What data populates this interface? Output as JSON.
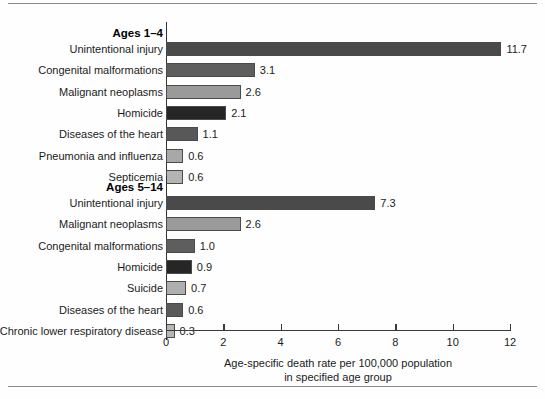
{
  "chart_data": {
    "type": "bar",
    "orientation": "horizontal",
    "title": "",
    "xlabel": "Age-specific death rate per 100,000 population in specified age group",
    "ylabel": "",
    "xlim": [
      0,
      12
    ],
    "xticks": [
      0,
      2,
      4,
      6,
      8,
      10,
      12
    ],
    "xtick_labels": [
      "0",
      "2",
      "4",
      "6",
      "8",
      "10",
      "12"
    ],
    "grid": false,
    "legend": "none",
    "groups": [
      {
        "name": "Ages 1–4",
        "categories": [
          "Unintentional injury",
          "Congenital malformations",
          "Malignant neoplasms",
          "Homicide",
          "Diseases of the heart",
          "Pneumonia and influenza",
          "Septicemia"
        ],
        "values": [
          11.7,
          3.1,
          2.6,
          2.1,
          1.1,
          0.6,
          0.6
        ],
        "value_labels": [
          "11.7",
          "3.1",
          "2.6",
          "2.1",
          "1.1",
          "0.6",
          "0.6"
        ],
        "colors": [
          "#4a4a4a",
          "#5e5e5e",
          "#9a9a9a",
          "#262626",
          "#585858",
          "#a8a8a8",
          "#b4b4b4"
        ]
      },
      {
        "name": "Ages 5–14",
        "categories": [
          "Unintentional injury",
          "Malignant neoplasms",
          "Congenital malformations",
          "Homicide",
          "Suicide",
          "Diseases of the heart",
          "Chronic lower respiratory disease"
        ],
        "values": [
          7.3,
          2.6,
          1.0,
          0.9,
          0.7,
          0.6,
          0.3
        ],
        "value_labels": [
          "7.3",
          "2.6",
          "1.0",
          "0.9",
          "0.7",
          "0.6",
          "0.3"
        ],
        "colors": [
          "#4a4a4a",
          "#9a9a9a",
          "#5e5e5e",
          "#262626",
          "#aeaeae",
          "#5a5a5a",
          "#b6b6b6"
        ]
      }
    ],
    "caption_line1": "Age-specific death rate per 100,000 population",
    "caption_line2": "in specified age group"
  }
}
